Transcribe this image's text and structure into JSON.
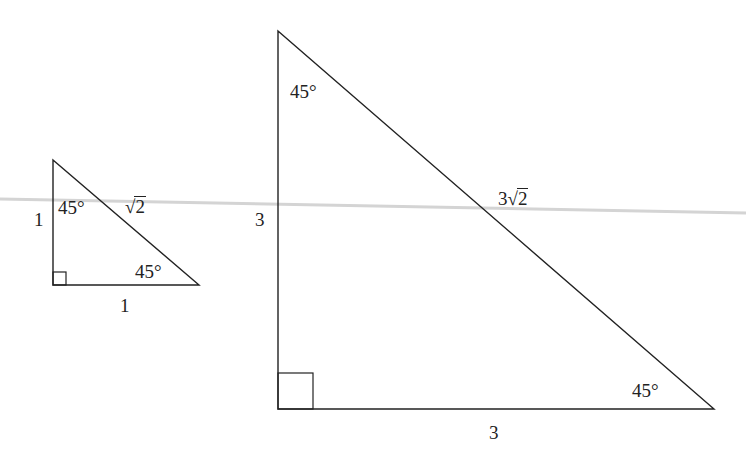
{
  "diagram": {
    "type": "two similar 45-45-90 right triangles",
    "colors": {
      "stroke": "#222222",
      "scan_line": "#cfcfcf",
      "background": "#ffffff"
    },
    "small_triangle": {
      "vertices": {
        "top": [
          53,
          160
        ],
        "right_angle": [
          53,
          285
        ],
        "right": [
          199,
          285
        ]
      },
      "leg_vertical_label": "1",
      "leg_horizontal_label": "1",
      "hypotenuse_coef": "",
      "hypotenuse_radicand": "2",
      "top_angle_label": "45°",
      "bottom_angle_label": "45°"
    },
    "large_triangle": {
      "vertices": {
        "top": [
          278,
          31
        ],
        "right_angle": [
          278,
          409
        ],
        "right": [
          714,
          409
        ]
      },
      "leg_vertical_label": "3",
      "leg_horizontal_label": "3",
      "hypotenuse_coef": "3",
      "hypotenuse_radicand": "2",
      "top_angle_label": "45°",
      "bottom_angle_label": "45°"
    }
  }
}
